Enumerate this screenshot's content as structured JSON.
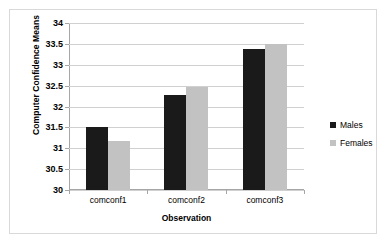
{
  "chart_data": {
    "type": "bar",
    "title": "",
    "xlabel": "Observation",
    "ylabel": "Computer Confidence Means",
    "categories": [
      "comconf1",
      "comconf2",
      "comconf3"
    ],
    "series": [
      {
        "name": "Males",
        "color": "#1a1a1a",
        "values": [
          31.5,
          32.27,
          33.38
        ]
      },
      {
        "name": "Females",
        "color": "#c2c2c2",
        "values": [
          31.17,
          32.47,
          33.5
        ]
      }
    ],
    "ylim": [
      30,
      34
    ],
    "ytick_step": 0.5,
    "yticks": [
      "30",
      "30.5",
      "31",
      "31.5",
      "32",
      "32.5",
      "33",
      "33.5",
      "34"
    ],
    "grid": "horizontal",
    "legend_position": "right"
  },
  "legend": {
    "entries": [
      {
        "label": "Males"
      },
      {
        "label": "Females"
      }
    ]
  }
}
